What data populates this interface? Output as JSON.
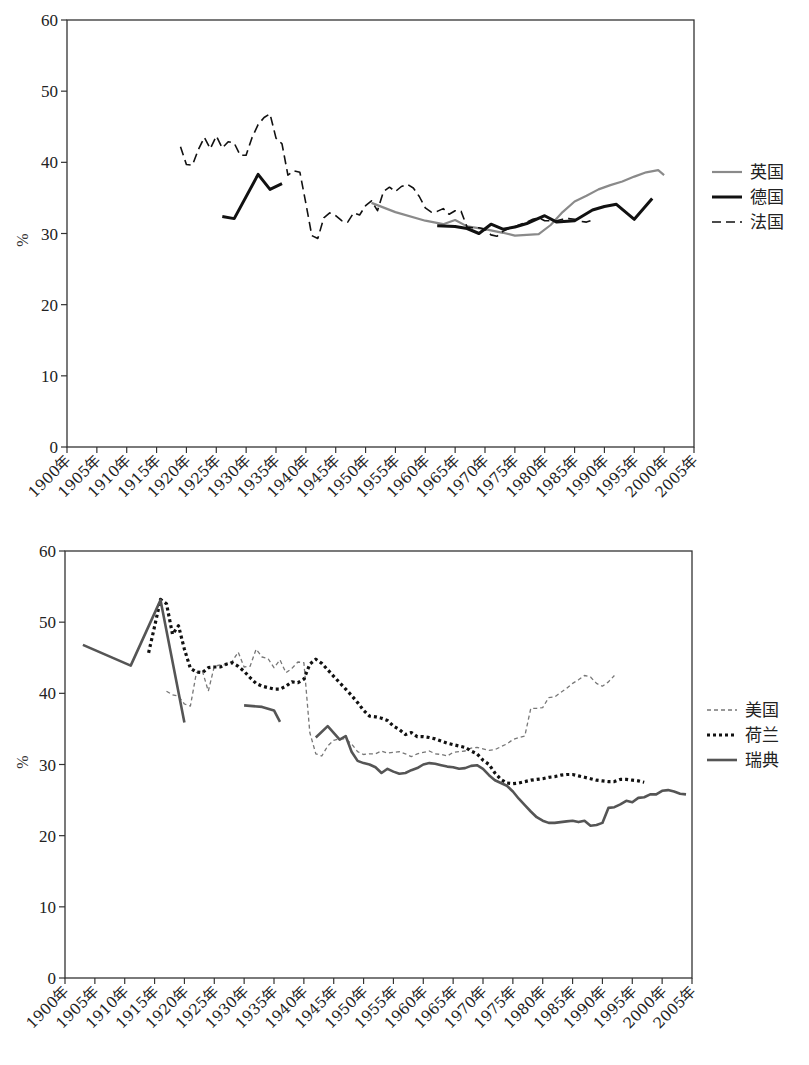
{
  "chart_data": [
    {
      "type": "line",
      "title": "",
      "xlabel": "",
      "ylabel": "%",
      "ylim": [
        0,
        60
      ],
      "xlim": [
        1900,
        2005
      ],
      "yticks": [
        "0",
        "10",
        "20",
        "30",
        "40",
        "50",
        "60"
      ],
      "xticks": [
        "1900年",
        "1905年",
        "1910年",
        "1915年",
        "1920年",
        "1925年",
        "1930年",
        "1935年",
        "1940年",
        "1945年",
        "1950年",
        "1955年",
        "1960年",
        "1965年",
        "1970年",
        "1975年",
        "1980年",
        "1985年",
        "1990年",
        "1995年",
        "2000年",
        "2005年"
      ],
      "grid": false,
      "legend_position": "right",
      "series": [
        {
          "name": "英国",
          "color": "#8a8a8a",
          "style": "solid",
          "width": 2.2,
          "x": [
            1951,
            1955,
            1960,
            1963,
            1965,
            1967,
            1970,
            1973,
            1975,
            1977,
            1979,
            1981,
            1983,
            1985,
            1987,
            1989,
            1991,
            1993,
            1995,
            1997,
            1999,
            2000
          ],
          "values": [
            34.3,
            33.0,
            31.8,
            31.3,
            31.9,
            31.0,
            30.6,
            30.1,
            29.7,
            29.8,
            29.9,
            31.2,
            33.0,
            34.5,
            35.3,
            36.2,
            36.8,
            37.3,
            38.0,
            38.6,
            38.9,
            38.2
          ]
        },
        {
          "name": "德国",
          "color": "#111111",
          "style": "solid",
          "width": 3,
          "x": [
            1926,
            1928,
            1932,
            1934,
            1936,
            null,
            1962,
            1965,
            1967,
            1969,
            1971,
            1973,
            1975,
            1977,
            1980,
            1982,
            1985,
            1988,
            1990,
            1992,
            1995,
            1998
          ],
          "values": [
            32.4,
            32.1,
            38.3,
            36.2,
            37.0,
            null,
            31.1,
            31.0,
            30.7,
            30.0,
            31.3,
            30.6,
            30.9,
            31.4,
            32.5,
            31.6,
            31.8,
            33.3,
            33.8,
            34.1,
            32.0,
            34.9
          ]
        },
        {
          "name": "法国",
          "color": "#111111",
          "style": "dashed",
          "width": 1.6,
          "x": [
            1919,
            1920,
            1921,
            1922,
            1923,
            1924,
            1925,
            1926,
            1927,
            1928,
            1929,
            1930,
            1931,
            1932,
            1933,
            1934,
            1935,
            1936,
            1937,
            1938,
            1939,
            1940,
            1941,
            1942,
            1943,
            1944,
            1945,
            1946,
            1947,
            1948,
            1949,
            1950,
            1951,
            1952,
            1953,
            1954,
            1955,
            1956,
            1957,
            1958,
            1959,
            1960,
            1961,
            1962,
            1963,
            1964,
            1965,
            1966,
            1967,
            1968,
            1969,
            1970,
            1971,
            1972,
            1973,
            1974,
            1975,
            1976,
            1977,
            1978,
            1979,
            1980,
            1981,
            1982,
            1983,
            1984,
            1985,
            1986,
            1987,
            1988,
            1989,
            1990,
            1991,
            1992,
            1993,
            1994,
            1995,
            1996,
            1997,
            1998
          ],
          "values": [
            42.2,
            39.7,
            39.6,
            41.8,
            43.5,
            41.9,
            43.7,
            42.0,
            42.9,
            42.7,
            41.0,
            41.0,
            43.5,
            45.3,
            46.3,
            46.8,
            43.4,
            42.6,
            38.2,
            38.8,
            38.6,
            34.2,
            29.7,
            29.3,
            32.2,
            32.9,
            32.5,
            31.8,
            31.6,
            32.9,
            32.6,
            33.9,
            34.6,
            33.2,
            35.9,
            36.5,
            35.9,
            36.6,
            36.9,
            36.4,
            35.2,
            33.6,
            33.0,
            33.1,
            33.5,
            32.7,
            33.2,
            33.1,
            30.9,
            30.8,
            30.8,
            30.6,
            29.8,
            29.6,
            30.3,
            30.7,
            31.0,
            31.3,
            31.6,
            32.0,
            32.2,
            31.8,
            31.8,
            31.8,
            32.0,
            32.1,
            32.0,
            31.7,
            31.6,
            31.9
          ]
        }
      ]
    },
    {
      "type": "line",
      "title": "",
      "xlabel": "",
      "ylabel": "%",
      "ylim": [
        0,
        60
      ],
      "xlim": [
        1900,
        2005
      ],
      "yticks": [
        "0",
        "10",
        "20",
        "30",
        "40",
        "50",
        "60"
      ],
      "xticks": [
        "1900年",
        "1905年",
        "1910年",
        "1915年",
        "1920年",
        "1925年",
        "1930年",
        "1935年",
        "1940年",
        "1945年",
        "1950年",
        "1955年",
        "1960年",
        "1965年",
        "1970年",
        "1975年",
        "1980年",
        "1985年",
        "1990年",
        "1995年",
        "2000年",
        "2005年"
      ],
      "grid": false,
      "legend_position": "right",
      "series": [
        {
          "name": "美国",
          "color": "#777777",
          "style": "dashed-fine",
          "width": 1.3,
          "x": [
            1917,
            1918,
            1919,
            1920,
            1921,
            1922,
            1923,
            1924,
            1925,
            1926,
            1927,
            1928,
            1929,
            1930,
            1931,
            1932,
            1933,
            1934,
            1935,
            1936,
            1937,
            1938,
            1939,
            1940,
            1941,
            1942,
            1943,
            1944,
            1945,
            1946,
            1947,
            1948,
            1949,
            1950,
            1951,
            1952,
            1953,
            1954,
            1955,
            1956,
            1957,
            1958,
            1959,
            1960,
            1961,
            1962,
            1963,
            1964,
            1965,
            1966,
            1967,
            1968,
            1969,
            1970,
            1971,
            1972,
            1973,
            1974,
            1975,
            1976,
            1977,
            1978,
            1979,
            1980,
            1981,
            1982,
            1983,
            1984,
            1985,
            1986,
            1987,
            1988,
            1989,
            1990,
            1991,
            1992,
            1993,
            1994,
            1995,
            1996,
            1997,
            1998,
            1999,
            2000,
            2001,
            2002,
            2003,
            2004
          ],
          "values": [
            40.3,
            39.8,
            39.6,
            38.5,
            38.2,
            42.9,
            43.2,
            40.3,
            43.8,
            44.0,
            44.0,
            44.5,
            45.8,
            43.7,
            43.8,
            46.2,
            45.1,
            44.9,
            43.6,
            44.7,
            42.9,
            43.5,
            44.4,
            44.3,
            34.5,
            31.5,
            31.2,
            32.6,
            33.4,
            33.6,
            33.6,
            32.9,
            31.8,
            31.4,
            31.5,
            31.5,
            31.9,
            31.6,
            31.7,
            31.8,
            31.5,
            31.1,
            31.5,
            31.7,
            31.9,
            31.5,
            31.4,
            31.2,
            31.7,
            31.8,
            31.9,
            32.3,
            32.4,
            32.2,
            32.0,
            32.1,
            32.5,
            32.9,
            33.5,
            33.8,
            34.0,
            37.9,
            37.9,
            38.0,
            39.4,
            39.5,
            40.1,
            40.7,
            41.4,
            41.9,
            42.5,
            42.3,
            41.4,
            41.0,
            41.6,
            42.5
          ]
        },
        {
          "name": "荷兰",
          "color": "#111111",
          "style": "dotted",
          "width": 3.2,
          "x": [
            1914,
            1915,
            1916,
            1917,
            1918,
            1919,
            1920,
            1921,
            1922,
            1923,
            1924,
            1925,
            1926,
            1927,
            1928,
            1929,
            1930,
            1931,
            1932,
            1933,
            1934,
            1935,
            1936,
            1937,
            1938,
            1939,
            1940,
            1941,
            1942,
            1943,
            1944,
            1945,
            1946,
            1947,
            1948,
            1949,
            1950,
            1951,
            1952,
            1953,
            1954,
            1955,
            1956,
            1957,
            1958,
            1959,
            1960,
            1961,
            1962,
            1963,
            1964,
            1965,
            1966,
            1967,
            1968,
            1969,
            1970,
            1971,
            1972,
            1973,
            1974,
            1975,
            1976,
            1977,
            1978,
            1979,
            1980,
            1981,
            1982,
            1983,
            1984,
            1985,
            1986,
            1987,
            1988,
            1989,
            1990,
            1991,
            1992,
            1993,
            1994,
            1995,
            1996,
            1997,
            1998,
            1999
          ],
          "values": [
            45.7,
            49.4,
            53.2,
            52.6,
            48.3,
            49.5,
            46.2,
            43.5,
            43.0,
            42.9,
            43.6,
            43.7,
            43.7,
            44.1,
            44.3,
            43.8,
            43.1,
            42.2,
            41.4,
            41.0,
            40.8,
            40.6,
            40.6,
            41.0,
            41.6,
            41.5,
            42.0,
            44.1,
            44.8,
            44.2,
            43.3,
            42.4,
            41.5,
            40.6,
            39.7,
            38.7,
            37.6,
            36.8,
            36.7,
            36.5,
            36.2,
            35.4,
            34.9,
            34.2,
            34.5,
            33.9,
            33.9,
            33.8,
            33.6,
            33.3,
            33.0,
            32.8,
            32.6,
            32.4,
            31.9,
            31.5,
            30.6,
            30.0,
            28.8,
            27.9,
            27.4,
            27.3,
            27.4,
            27.6,
            27.8,
            27.9,
            28.0,
            28.2,
            28.3,
            28.5,
            28.6,
            28.6,
            28.4,
            28.2,
            28.0,
            27.8,
            27.7,
            27.6,
            27.6,
            27.9,
            27.9,
            27.8,
            27.7,
            27.5
          ]
        },
        {
          "name": "瑞典",
          "color": "#555555",
          "style": "solid",
          "width": 2.6,
          "x": [
            1903,
            1911,
            1916,
            1920,
            null,
            1930,
            1933,
            1935,
            1936,
            null,
            1942,
            1944,
            1946,
            1947,
            1948,
            1949,
            1950,
            1951,
            1952,
            1953,
            1954,
            1955,
            1956,
            1957,
            1958,
            1959,
            1960,
            1961,
            1962,
            1963,
            1964,
            1965,
            1966,
            1967,
            1968,
            1969,
            1970,
            1971,
            1972,
            1973,
            1974,
            1975,
            1976,
            1977,
            1978,
            1979,
            1980,
            1981,
            1982,
            1983,
            1984,
            1985,
            1986,
            1987,
            1988,
            1989,
            1990,
            1991,
            1992,
            1993,
            1994,
            1995,
            1996,
            1997,
            1998,
            1999,
            2000,
            2001,
            2002,
            2003,
            2004
          ],
          "values": [
            46.8,
            43.9,
            53.1,
            35.9,
            null,
            38.3,
            38.1,
            37.6,
            36.0,
            null,
            33.8,
            35.4,
            33.5,
            34.0,
            31.8,
            30.5,
            30.2,
            30.0,
            29.6,
            28.8,
            29.4,
            29.0,
            28.7,
            28.8,
            29.2,
            29.5,
            30.0,
            30.2,
            30.1,
            29.9,
            29.7,
            29.6,
            29.4,
            29.5,
            29.8,
            29.9,
            29.4,
            28.5,
            27.8,
            27.4,
            27.0,
            26.2,
            25.2,
            24.3,
            23.4,
            22.6,
            22.1,
            21.8,
            21.8,
            21.9,
            22.0,
            22.1,
            21.9,
            22.1,
            21.4,
            21.5,
            21.8,
            23.9,
            24.0,
            24.4,
            24.9,
            24.7,
            25.3,
            25.4,
            25.8,
            25.8,
            26.3,
            26.4,
            26.2,
            25.9,
            25.8
          ]
        }
      ]
    }
  ],
  "top_chart": {
    "ylabel": "%",
    "legend": [
      {
        "label": "英国"
      },
      {
        "label": "德国"
      },
      {
        "label": "法国"
      }
    ]
  },
  "bottom_chart": {
    "ylabel": "%",
    "legend": [
      {
        "label": "美国"
      },
      {
        "label": "荷兰"
      },
      {
        "label": "瑞典"
      }
    ]
  }
}
